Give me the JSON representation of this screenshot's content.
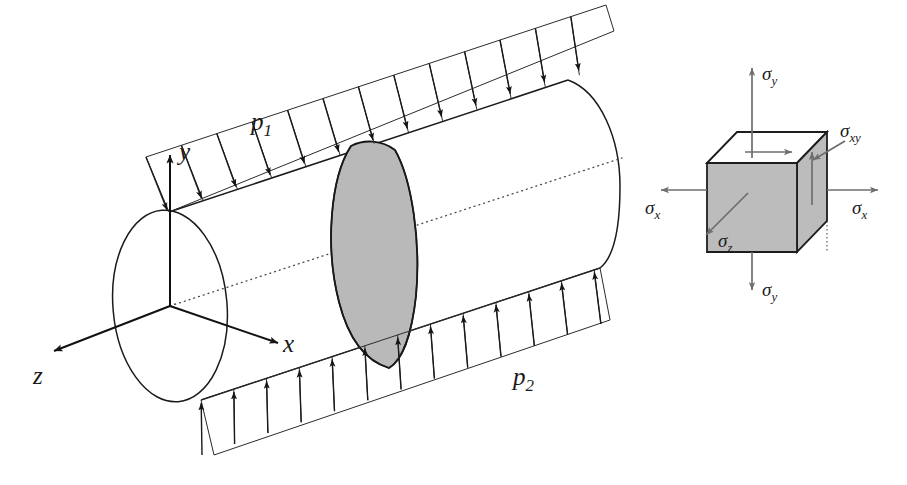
{
  "figure": {
    "type": "engineering-stress-diagram",
    "background_color": "#ffffff",
    "shade_color": "#bcbcbc",
    "line_color": "#1a1a1a",
    "width": 907,
    "height": 485
  },
  "axes": {
    "y_label": "y",
    "x_label": "x",
    "z_label": "z"
  },
  "pressures": {
    "top_label": "p",
    "top_sub": "1",
    "bottom_label": "p",
    "bottom_sub": "2",
    "top_arrow_count": 13,
    "bottom_arrow_count": 13,
    "top_direction": "downward onto cylinder",
    "bottom_direction": "upward onto cylinder"
  },
  "cylinder": {
    "has_shaded_ring": true,
    "ring_position": "mid-span",
    "centerline_style": "dotted"
  },
  "stress_cube": {
    "labels": {
      "sigma_y_top": "σ",
      "sigma_y_top_sub": "y",
      "sigma_y_bottom": "σ",
      "sigma_y_bottom_sub": "y",
      "sigma_x_left": "σ",
      "sigma_x_left_sub": "x",
      "sigma_x_right": "σ",
      "sigma_x_right_sub": "x",
      "sigma_xy": "σ",
      "sigma_xy_sub": "xy",
      "sigma_z": "σ",
      "sigma_z_sub": "z"
    },
    "face_shading": {
      "front": "#bcbcbc",
      "right": "#bcbcbc",
      "top": "#ffffff"
    }
  }
}
